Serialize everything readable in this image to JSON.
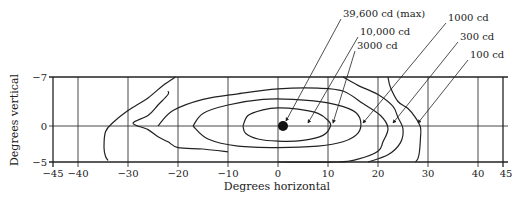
{
  "chart_data": {
    "type": "contour",
    "title": "",
    "xlabel": "Degrees horizontal",
    "ylabel": "Degrees vertical",
    "xlim": [
      -45,
      45
    ],
    "ylim": [
      -7,
      -5
    ],
    "x_ticks": [
      -45,
      -40,
      -30,
      -20,
      -10,
      0,
      10,
      20,
      30,
      40,
      45
    ],
    "y_ticks": [
      -7,
      0,
      -5
    ],
    "x_tick_labels": [
      "−45",
      "−40",
      "−30",
      "−20",
      "−10",
      "0",
      "10",
      "20",
      "30",
      "40",
      "45"
    ],
    "y_tick_labels": [
      "−7",
      "0",
      "−5"
    ],
    "grid": true,
    "max_point": {
      "x": 1,
      "y": 0,
      "label": "39,600 cd (max)"
    },
    "series": [
      {
        "name": "10,000 cd",
        "value_cd": 10000,
        "points": [
          [
            -7,
            0
          ],
          [
            -6,
            -1.5
          ],
          [
            -3,
            -2.3
          ],
          [
            0,
            -2.6
          ],
          [
            4,
            -2.4
          ],
          [
            8,
            -1.8
          ],
          [
            10,
            -0.8
          ],
          [
            10.5,
            0
          ],
          [
            9,
            1.3
          ],
          [
            5,
            2.0
          ],
          [
            0,
            2.1
          ],
          [
            -4,
            1.8
          ],
          [
            -6.5,
            1.0
          ],
          [
            -7,
            0
          ]
        ]
      },
      {
        "name": "3000 cd",
        "value_cd": 3000,
        "points": [
          [
            -17,
            0
          ],
          [
            -15,
            -1.8
          ],
          [
            -10,
            -3.0
          ],
          [
            -3,
            -3.8
          ],
          [
            3,
            -3.8
          ],
          [
            10,
            -3.3
          ],
          [
            15,
            -2.2
          ],
          [
            16.5,
            -0.8
          ],
          [
            16,
            1.0
          ],
          [
            13,
            2.2
          ],
          [
            8,
            2.8
          ],
          [
            0,
            3.0
          ],
          [
            -8,
            2.8
          ],
          [
            -14,
            1.8
          ],
          [
            -17,
            0
          ]
        ]
      },
      {
        "name": "1000 cd",
        "value_cd": 1000,
        "points": [
          [
            -24,
            0
          ],
          [
            -21,
            -2.2
          ],
          [
            -15,
            -3.8
          ],
          [
            -8,
            -4.6
          ],
          [
            0,
            -5.3
          ],
          [
            8,
            -5.4
          ],
          [
            13,
            -5.0
          ],
          [
            17,
            -3.2
          ],
          [
            20.5,
            -1.5
          ],
          [
            22,
            0.3
          ],
          [
            21,
            2.2
          ],
          [
            20,
            3.5
          ],
          [
            16,
            4.6
          ],
          [
            12,
            5.0
          ],
          [
            0,
            5.0
          ]
        ]
      },
      {
        "name": "300 cd",
        "value_cd": 300,
        "points": [
          [
            -22,
            -5
          ],
          [
            -22,
            -4.5
          ],
          [
            -24,
            -3.0
          ],
          [
            -26,
            -1.5
          ],
          [
            -29,
            -0.4
          ],
          [
            -26,
            0.5
          ],
          [
            -24,
            1.5
          ],
          [
            -22,
            2.2
          ],
          [
            -20,
            3.0
          ],
          [
            -15,
            3.2
          ],
          [
            -10,
            3.6
          ]
        ]
      },
      {
        "name": "300 cd (right)",
        "value_cd": 300,
        "points": [
          [
            13,
            -7
          ],
          [
            16,
            -5.8
          ],
          [
            20,
            -4.5
          ],
          [
            23,
            -2.8
          ],
          [
            24,
            -1.2
          ],
          [
            25,
            0.4
          ],
          [
            24.5,
            2.3
          ],
          [
            22,
            4.0
          ],
          [
            18,
            5.0
          ]
        ]
      },
      {
        "name": "100 cd",
        "value_cd": 100,
        "points": [
          [
            -20.5,
            -7
          ],
          [
            -23,
            -5.8
          ],
          [
            -26,
            -4.0
          ],
          [
            -30,
            -2.2
          ],
          [
            -33,
            -0.5
          ],
          [
            -34.5,
            0.8
          ],
          [
            -34.8,
            3.0
          ],
          [
            -34.5,
            4.2
          ],
          [
            -34,
            4.8
          ]
        ]
      },
      {
        "name": "100 cd (right)",
        "value_cd": 100,
        "points": [
          [
            22,
            -7
          ],
          [
            22.5,
            -5.5
          ],
          [
            24,
            -3.5
          ],
          [
            26,
            -2.5
          ],
          [
            27.5,
            -1.2
          ],
          [
            28.5,
            0.2
          ],
          [
            28.5,
            1.6
          ],
          [
            28.3,
            3.5
          ],
          [
            28,
            4.5
          ],
          [
            27.5,
            5.0
          ]
        ]
      }
    ],
    "annotations": [
      {
        "label": "39,600 cd (max)",
        "target": [
          1,
          0
        ]
      },
      {
        "label": "10,000 cd",
        "target": [
          6,
          0
        ]
      },
      {
        "label": "3000 cd",
        "target": [
          11,
          0
        ]
      },
      {
        "label": "1000 cd",
        "target": [
          17,
          0
        ]
      },
      {
        "label": "300 cd",
        "target": [
          23,
          0
        ]
      },
      {
        "label": "100 cd",
        "target": [
          28,
          0
        ]
      }
    ]
  }
}
